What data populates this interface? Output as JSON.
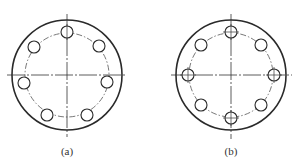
{
  "figure": {
    "panels": [
      {
        "id": "a",
        "label": "(a)",
        "center": [
          67,
          75
        ],
        "outer_radius": 55,
        "pitch_radius": 42,
        "hole_radius": 6,
        "hole_count": 7,
        "holes": [
          {
            "x": 67,
            "y": 32,
            "crosshair": "v"
          },
          {
            "x": 34,
            "y": 47,
            "crosshair": ""
          },
          {
            "x": 99,
            "y": 46,
            "crosshair": ""
          },
          {
            "x": 24,
            "y": 83,
            "crosshair": ""
          },
          {
            "x": 107,
            "y": 82,
            "crosshair": ""
          },
          {
            "x": 47,
            "y": 115,
            "crosshair": ""
          },
          {
            "x": 87,
            "y": 115,
            "crosshair": ""
          }
        ],
        "v_axis": [
          14,
          137
        ],
        "h_axis": [
          7,
          127
        ]
      },
      {
        "id": "b",
        "label": "(b)",
        "center": [
          231,
          75
        ],
        "outer_radius": 55,
        "pitch_radius": 42,
        "hole_radius": 6,
        "hole_count": 8,
        "holes": [
          {
            "x": 231,
            "y": 32,
            "crosshair": "both"
          },
          {
            "x": 261,
            "y": 45,
            "crosshair": ""
          },
          {
            "x": 274,
            "y": 75,
            "crosshair": "both"
          },
          {
            "x": 261,
            "y": 105,
            "crosshair": ""
          },
          {
            "x": 231,
            "y": 118,
            "crosshair": "both"
          },
          {
            "x": 201,
            "y": 105,
            "crosshair": ""
          },
          {
            "x": 188,
            "y": 75,
            "crosshair": "both"
          },
          {
            "x": 201,
            "y": 45,
            "crosshair": ""
          }
        ],
        "v_axis": [
          14,
          139
        ],
        "h_axis": [
          171,
          292
        ]
      }
    ],
    "colors": {
      "line": "#2a2a2a",
      "background": "#ffffff"
    }
  }
}
